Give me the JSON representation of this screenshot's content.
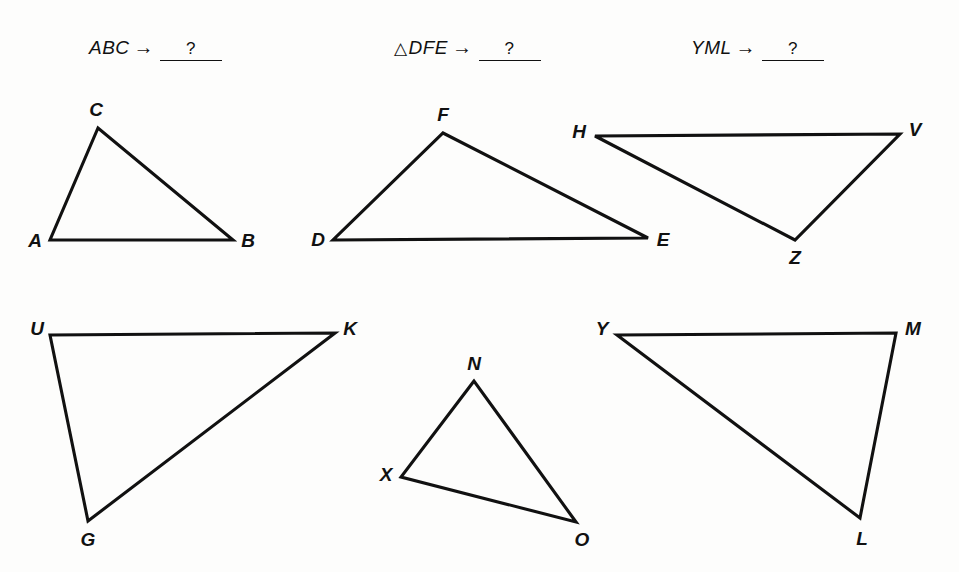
{
  "page": {
    "background_color": "#fdfdfc",
    "ink_color": "#111111"
  },
  "prompts": [
    {
      "id": "prompt-abc",
      "triangle_symbol": "",
      "name": "ABC",
      "arrow": "→",
      "answer": "?",
      "x": 88,
      "y": 47
    },
    {
      "id": "prompt-dfe",
      "triangle_symbol": "△",
      "name": "DFE",
      "arrow": "→",
      "answer": "?",
      "x": 394,
      "y": 47
    },
    {
      "id": "prompt-yml",
      "triangle_symbol": "",
      "name": "YML",
      "arrow": "→",
      "answer": "?",
      "x": 690,
      "y": 47
    }
  ],
  "figures": [
    {
      "id": "triangle-abc",
      "name": "triangle-abc",
      "vertices": [
        {
          "label": "A",
          "x": 50,
          "y": 240,
          "label_x": 35,
          "label_y": 241
        },
        {
          "label": "B",
          "x": 233,
          "y": 240,
          "label_x": 248,
          "label_y": 241
        },
        {
          "label": "C",
          "x": 98,
          "y": 128,
          "label_x": 96,
          "label_y": 110
        }
      ]
    },
    {
      "id": "triangle-dfe",
      "name": "triangle-dfe",
      "vertices": [
        {
          "label": "D",
          "x": 333,
          "y": 240,
          "label_x": 318,
          "label_y": 240
        },
        {
          "label": "E",
          "x": 648,
          "y": 238,
          "label_x": 663,
          "label_y": 240
        },
        {
          "label": "F",
          "x": 443,
          "y": 133,
          "label_x": 443,
          "label_y": 115
        }
      ]
    },
    {
      "id": "triangle-hvz",
      "name": "triangle-hvz",
      "vertices": [
        {
          "label": "H",
          "x": 595,
          "y": 136,
          "label_x": 579,
          "label_y": 132
        },
        {
          "label": "V",
          "x": 900,
          "y": 134,
          "label_x": 915,
          "label_y": 130
        },
        {
          "label": "Z",
          "x": 795,
          "y": 240,
          "label_x": 795,
          "label_y": 258
        }
      ]
    },
    {
      "id": "triangle-ukg",
      "name": "triangle-ukg",
      "vertices": [
        {
          "label": "U",
          "x": 50,
          "y": 335,
          "label_x": 37,
          "label_y": 329
        },
        {
          "label": "K",
          "x": 335,
          "y": 333,
          "label_x": 350,
          "label_y": 329
        },
        {
          "label": "G",
          "x": 88,
          "y": 521,
          "label_x": 88,
          "label_y": 540
        }
      ]
    },
    {
      "id": "triangle-xno",
      "name": "triangle-xno",
      "vertices": [
        {
          "label": "N",
          "x": 474,
          "y": 381,
          "label_x": 474,
          "label_y": 364
        },
        {
          "label": "X",
          "x": 401,
          "y": 477,
          "label_x": 386,
          "label_y": 475
        },
        {
          "label": "O",
          "x": 576,
          "y": 522,
          "label_x": 582,
          "label_y": 540
        }
      ]
    },
    {
      "id": "triangle-yml",
      "name": "triangle-yml",
      "vertices": [
        {
          "label": "Y",
          "x": 617,
          "y": 335,
          "label_x": 602,
          "label_y": 329
        },
        {
          "label": "M",
          "x": 896,
          "y": 333,
          "label_x": 913,
          "label_y": 329
        },
        {
          "label": "L",
          "x": 860,
          "y": 518,
          "label_x": 862,
          "label_y": 539
        }
      ]
    }
  ]
}
